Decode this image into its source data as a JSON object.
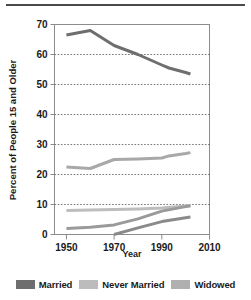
{
  "chart_data": {
    "type": "line",
    "title": "",
    "xlabel": "Year",
    "ylabel": "Percent of People 15 and Older",
    "xlim": [
      1945,
      2010
    ],
    "ylim": [
      0,
      70
    ],
    "xticks": [
      1950,
      1970,
      1990,
      2010
    ],
    "yticks": [
      0,
      10,
      20,
      30,
      40,
      50,
      60,
      70
    ],
    "gridlines": [
      10,
      20,
      30,
      40,
      50,
      60
    ],
    "grid": true,
    "legend_position": "bottom",
    "series": [
      {
        "name": "Married",
        "color": "#6e6e6e",
        "x": [
          1950,
          1960,
          1970,
          1980,
          1990,
          1993,
          2000,
          2002
        ],
        "values": [
          66.5,
          68.0,
          63.0,
          60.0,
          56.5,
          55.5,
          54.0,
          53.5
        ]
      },
      {
        "name": "Never Married",
        "color": "#a8a8a8",
        "x": [
          1950,
          1960,
          1970,
          1980,
          1990,
          1993,
          2000,
          2002
        ],
        "values": [
          22.5,
          22.0,
          25.0,
          25.2,
          25.5,
          26.2,
          27.0,
          27.3
        ]
      },
      {
        "name": "Widowed",
        "color": "#bdbdbd",
        "x": [
          1950,
          1960,
          1970,
          1980,
          1990,
          2000,
          2002
        ],
        "values": [
          8.0,
          8.2,
          8.3,
          8.5,
          8.8,
          9.5,
          9.6
        ]
      },
      {
        "name": "Divorced",
        "color": "#9a9a9a",
        "x": [
          1950,
          1960,
          1970,
          1980,
          1990,
          2000,
          2002
        ],
        "values": [
          2.0,
          2.4,
          3.2,
          5.2,
          7.8,
          9.3,
          9.6
        ]
      },
      {
        "name": "Separated",
        "color": "#8a8a8a",
        "x": [
          1970,
          1980,
          1990,
          2000,
          2002
        ],
        "values": [
          0.0,
          2.2,
          4.3,
          5.6,
          5.8
        ]
      }
    ]
  },
  "axes": {
    "y_title": "Percent of People 15 and Older",
    "x_title": "Year",
    "y_tick_labels": [
      "70",
      "60",
      "50",
      "40",
      "30",
      "20",
      "10",
      "0"
    ],
    "x_tick_labels": [
      "1950",
      "1970",
      "1990",
      "2010"
    ]
  },
  "legend": {
    "items": [
      {
        "label": "Married",
        "color": "#6e6e6e"
      },
      {
        "label": "Never Married",
        "color": "#bcbcbc"
      },
      {
        "label": "Widowed",
        "color": "#b0b0b0"
      }
    ]
  },
  "colors": {
    "axis": "#8c8c8c",
    "grid": "#555555",
    "text": "#1a1a1a",
    "rule": "#4a4a4a",
    "background": "#ffffff"
  }
}
